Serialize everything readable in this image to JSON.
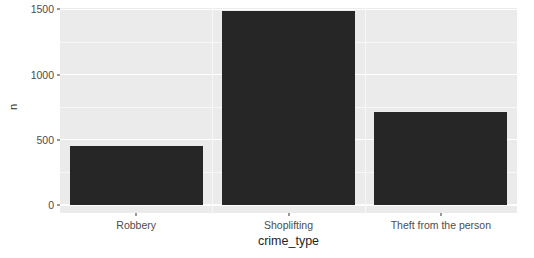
{
  "chart_data": {
    "type": "bar",
    "title": "",
    "subtitle": "",
    "xlabel": "crime_type",
    "ylabel": "n",
    "categories": [
      "Robbery",
      "Shoplifting",
      "Theft from the person"
    ],
    "values": [
      456,
      1484,
      710
    ],
    "series": [
      {
        "name": "n",
        "values": [
          456,
          1484,
          710
        ]
      }
    ],
    "ylim": [
      0,
      1510
    ],
    "y_ticks": [
      0,
      500,
      1000,
      1500
    ],
    "y_tick_labels": [
      "0",
      "500",
      "1000",
      "1500"
    ],
    "y_minor_ticks": [
      250,
      750,
      1250
    ],
    "grid": true,
    "legend": false,
    "legend_position": "none",
    "bar_color": "#262626",
    "panel_background": "#ebebeb",
    "gridline_color": "#ffffff",
    "annotations": []
  },
  "axes": {
    "y_title": "n",
    "x_title": "crime_type"
  }
}
